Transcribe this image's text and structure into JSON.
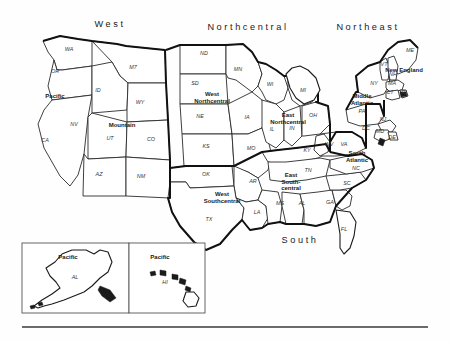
{
  "figure": {
    "background": "#fefefe",
    "ink": "#1a1a1a",
    "region_border_color": "#111111",
    "state_border_color": "#2a2a2a"
  },
  "major_regions": [
    {
      "id": "west",
      "label": "West",
      "x": 110,
      "y": 27
    },
    {
      "id": "northcentral",
      "label": "Northcentral",
      "x": 248,
      "y": 30
    },
    {
      "id": "northeast",
      "label": "Northeast",
      "x": 368,
      "y": 30
    },
    {
      "id": "south",
      "label": "South",
      "x": 300,
      "y": 243
    }
  ],
  "divisions": [
    {
      "id": "pacific",
      "label": "Pacific",
      "x": 55,
      "y": 98,
      "lines": [
        "Pacific"
      ]
    },
    {
      "id": "mountain",
      "label": "Mountain",
      "x": 122,
      "y": 127,
      "lines": [
        "Mountain"
      ]
    },
    {
      "id": "west-northcentral",
      "label": "West Northcentral",
      "x": 212,
      "y": 96,
      "lines": [
        "West",
        "Northcentral"
      ]
    },
    {
      "id": "east-northcentral",
      "label": "East Northcentral",
      "x": 288,
      "y": 117,
      "lines": [
        "East",
        "Northcentral"
      ]
    },
    {
      "id": "middle-atlantic",
      "label": "Middle Atlantic",
      "x": 362,
      "y": 98,
      "lines": [
        "Middle",
        "Atlantic"
      ]
    },
    {
      "id": "new-england",
      "label": "New England",
      "x": 404,
      "y": 72,
      "lines": [
        "New England"
      ]
    },
    {
      "id": "west-southcentral",
      "label": "West Southcentral",
      "x": 222,
      "y": 196,
      "lines": [
        "West",
        "Southcentral"
      ]
    },
    {
      "id": "east-southcentral",
      "label": "East Southcentral",
      "x": 291,
      "y": 177,
      "lines": [
        "East",
        "South-",
        "central"
      ]
    },
    {
      "id": "south-atlantic",
      "label": "South Atlantic",
      "x": 357,
      "y": 155,
      "lines": [
        "South",
        "Atlantic"
      ]
    },
    {
      "id": "pacific-alaska",
      "label": "Pacific",
      "x": 68,
      "y": 259,
      "lines": [
        "Pacific"
      ]
    },
    {
      "id": "pacific-hawaii",
      "label": "Pacific",
      "x": 160,
      "y": 259,
      "lines": [
        "Pacific"
      ]
    }
  ],
  "states": [
    {
      "abbr": "WA",
      "x": 69,
      "y": 51
    },
    {
      "abbr": "OR",
      "x": 55,
      "y": 73
    },
    {
      "abbr": "M7",
      "x": 133,
      "y": 69
    },
    {
      "abbr": "ID",
      "x": 98,
      "y": 92
    },
    {
      "abbr": "WY",
      "x": 140,
      "y": 104
    },
    {
      "abbr": "NV",
      "x": 74,
      "y": 126
    },
    {
      "abbr": "CA",
      "x": 45,
      "y": 142
    },
    {
      "abbr": "UT",
      "x": 110,
      "y": 140
    },
    {
      "abbr": "CO",
      "x": 151,
      "y": 141
    },
    {
      "abbr": "AZ",
      "x": 99,
      "y": 176
    },
    {
      "abbr": "NM",
      "x": 141,
      "y": 178
    },
    {
      "abbr": "ND",
      "x": 204,
      "y": 55
    },
    {
      "abbr": "SD",
      "x": 195,
      "y": 85
    },
    {
      "abbr": "MN",
      "x": 238,
      "y": 71
    },
    {
      "abbr": "NE",
      "x": 200,
      "y": 118
    },
    {
      "abbr": "IA",
      "x": 247,
      "y": 119
    },
    {
      "abbr": "KS",
      "x": 206,
      "y": 148
    },
    {
      "abbr": "MO",
      "x": 251,
      "y": 150
    },
    {
      "abbr": "WI",
      "x": 270,
      "y": 86
    },
    {
      "abbr": "MI",
      "x": 303,
      "y": 92
    },
    {
      "abbr": "IL",
      "x": 272,
      "y": 131
    },
    {
      "abbr": "IN",
      "x": 292,
      "y": 130
    },
    {
      "abbr": "OH",
      "x": 313,
      "y": 117
    },
    {
      "abbr": "KY",
      "x": 307,
      "y": 152
    },
    {
      "abbr": "TN",
      "x": 308,
      "y": 172
    },
    {
      "abbr": "OK",
      "x": 206,
      "y": 176
    },
    {
      "abbr": "AR",
      "x": 253,
      "y": 183
    },
    {
      "abbr": "TX",
      "x": 209,
      "y": 221
    },
    {
      "abbr": "LA",
      "x": 257,
      "y": 214
    },
    {
      "abbr": "MS",
      "x": 280,
      "y": 205
    },
    {
      "abbr": "AL",
      "x": 302,
      "y": 205
    },
    {
      "abbr": "GA",
      "x": 330,
      "y": 204
    },
    {
      "abbr": "FL",
      "x": 344,
      "y": 231
    },
    {
      "abbr": "SC",
      "x": 347,
      "y": 185
    },
    {
      "abbr": "NC",
      "x": 356,
      "y": 170
    },
    {
      "abbr": "VA",
      "x": 344,
      "y": 146
    },
    {
      "abbr": "WV",
      "x": 329,
      "y": 146
    },
    {
      "abbr": "MD",
      "x": 380,
      "y": 133
    },
    {
      "abbr": "DE",
      "x": 392,
      "y": 139
    },
    {
      "abbr": "DC",
      "x": 366,
      "y": 130
    },
    {
      "abbr": "PA",
      "x": 362,
      "y": 113
    },
    {
      "abbr": "NJ",
      "x": 383,
      "y": 121
    },
    {
      "abbr": "NY",
      "x": 374,
      "y": 85
    },
    {
      "abbr": "VT",
      "x": 384,
      "y": 66
    },
    {
      "abbr": "NH",
      "x": 393,
      "y": 76
    },
    {
      "abbr": "ME",
      "x": 410,
      "y": 52
    },
    {
      "abbr": "MA",
      "x": 392,
      "y": 85
    },
    {
      "abbr": "CT",
      "x": 390,
      "y": 94
    },
    {
      "abbr": "RI",
      "x": 404,
      "y": 94
    },
    {
      "abbr": "AL",
      "x": 75,
      "y": 279
    },
    {
      "abbr": "HI",
      "x": 165,
      "y": 284
    }
  ],
  "insets": [
    {
      "id": "alaska-inset",
      "x": 22,
      "y": 243,
      "w": 107,
      "h": 70
    },
    {
      "id": "hawaii-inset",
      "x": 129,
      "y": 243,
      "w": 76,
      "h": 70
    }
  ],
  "footer_rule": {
    "x1": 22,
    "y1": 327,
    "x2": 428,
    "y2": 327
  }
}
